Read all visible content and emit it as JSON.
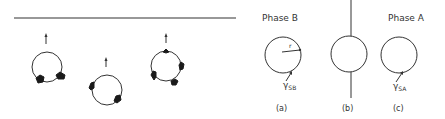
{
  "left_panel": {
    "description": "Three rings with attached flux markers and upward arrows, below a horizontal boundary line",
    "rings": [
      {
        "id": "ring-1",
        "markers": 2,
        "arrow": "up"
      },
      {
        "id": "ring-2",
        "markers": 2,
        "arrow": "up"
      },
      {
        "id": "ring-3",
        "markers": 4,
        "arrow": "up"
      }
    ]
  },
  "right_panel": {
    "phase_b_title": "Phase B",
    "phase_a_title": "Phase A",
    "radius_label": "r",
    "gamma_b": {
      "symbol": "γ",
      "subscript": "SB"
    },
    "gamma_a": {
      "symbol": "γ",
      "subscript": "SA"
    },
    "captions": {
      "a": "(a)",
      "b": "(b)",
      "c": "(c)"
    }
  }
}
